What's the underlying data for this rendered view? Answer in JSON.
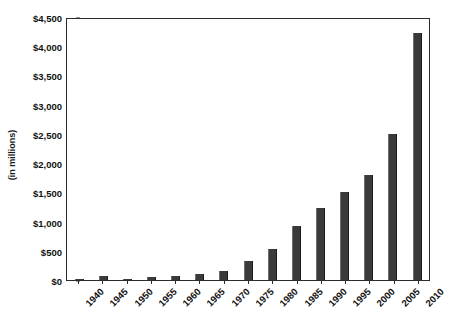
{
  "chart_data": {
    "type": "bar",
    "title": "",
    "xlabel": "",
    "ylabel": "(in millions)",
    "categories": [
      "1940",
      "1945",
      "1950",
      "1955",
      "1960",
      "1965",
      "1970",
      "1975",
      "1980",
      "1985",
      "1990",
      "1995",
      "2000",
      "2005",
      "2010"
    ],
    "values": [
      10,
      75,
      25,
      45,
      70,
      95,
      155,
      325,
      530,
      920,
      1240,
      1510,
      1790,
      2500,
      4230
    ],
    "ylim": [
      0,
      4500
    ],
    "ytick_values": [
      0,
      500,
      1000,
      1500,
      2000,
      2500,
      3000,
      3500,
      4000,
      4500
    ],
    "ytick_labels": [
      "$0",
      "$500",
      "$1,000",
      "$1,500",
      "$2,000",
      "$2,500",
      "$3,000",
      "$3,500",
      "$4,000",
      "$4,500"
    ],
    "grid": false,
    "legend": "none",
    "series": [
      {
        "name": "",
        "values": [
          10,
          75,
          25,
          45,
          70,
          95,
          155,
          325,
          530,
          920,
          1240,
          1510,
          1790,
          2500,
          4230
        ]
      }
    ],
    "bar_color": "#3a3a3a",
    "axis_color": "#2b2b2b",
    "xtick_rotation": -45
  },
  "cropped_title_remnant": "—"
}
